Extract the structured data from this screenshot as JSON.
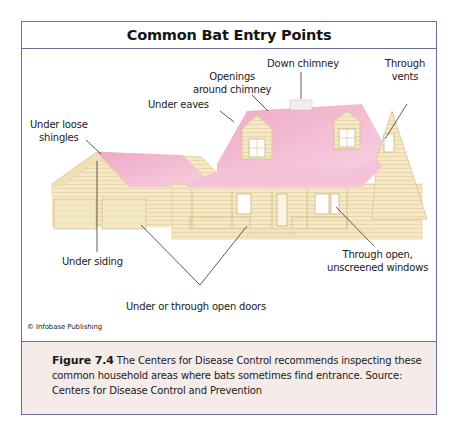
{
  "figure": {
    "title": "Common Bat Entry Points",
    "labels": {
      "down_chimney": "Down chimney",
      "through_vents_1": "Through",
      "through_vents_2": "vents",
      "openings_chimney_1": "Openings",
      "openings_chimney_2": "around chimney",
      "under_eaves": "Under eaves",
      "loose_shingles_1": "Under loose",
      "loose_shingles_2": "shingles",
      "under_siding": "Under siding",
      "open_windows_1": "Through open,",
      "open_windows_2": "unscreened windows",
      "open_doors": "Under or through open doors"
    },
    "credit": "© Infobase Publishing",
    "caption_label": "Figure 7.4",
    "caption_text": "The Centers for Disease Control recommends inspecting these common household areas where bats sometimes find entrance. Source: Centers for Disease Control and Prevention"
  },
  "colors": {
    "frame": "#6a6f9a",
    "roof": "#f2b8d0",
    "roof_light": "#f8d3e2",
    "siding": "#f3e6c6",
    "siding_line": "#dcc89a",
    "trim": "#efe0b8",
    "caption_bg": "#f5ecea"
  }
}
